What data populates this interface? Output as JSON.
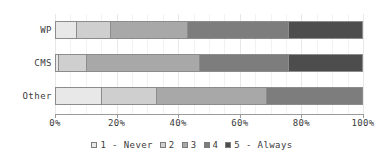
{
  "chart_data": {
    "type": "bar",
    "orientation": "horizontal",
    "stacked": "100%",
    "title": "",
    "xlabel": "",
    "ylabel": "",
    "categories": [
      "WP",
      "CMS",
      "Other"
    ],
    "xlim": [
      0,
      100
    ],
    "xticks": [
      0,
      20,
      40,
      60,
      80,
      100
    ],
    "xticklabels": [
      "0%",
      "20%",
      "40%",
      "60%",
      "80%",
      "100%"
    ],
    "grid": true,
    "legend_position": "bottom",
    "series": [
      {
        "name": "1 - Never",
        "color": "#e8e8e8",
        "values": [
          7,
          1,
          15
        ]
      },
      {
        "name": "2",
        "color": "#cfcfcf",
        "values": [
          11,
          9,
          18
        ]
      },
      {
        "name": "3",
        "color": "#a8a8a8",
        "values": [
          25,
          37,
          36
        ]
      },
      {
        "name": "4",
        "color": "#7d7d7d",
        "values": [
          33,
          29,
          31
        ]
      },
      {
        "name": "5 - Always",
        "color": "#4d4d4d",
        "values": [
          24,
          24,
          0
        ]
      }
    ]
  },
  "axis": {
    "ticks": [
      {
        "label": "0%",
        "value": 0
      },
      {
        "label": "20%",
        "value": 20
      },
      {
        "label": "40%",
        "value": 40
      },
      {
        "label": "60%",
        "value": 60
      },
      {
        "label": "80%",
        "value": 80
      },
      {
        "label": "100%",
        "value": 100
      }
    ]
  },
  "categories": [
    {
      "label": "WP"
    },
    {
      "label": "CMS"
    },
    {
      "label": "Other"
    }
  ],
  "legend": {
    "items": [
      {
        "label": "1 - Never",
        "color": "#e8e8e8"
      },
      {
        "label": "2",
        "color": "#cfcfcf"
      },
      {
        "label": "3",
        "color": "#a8a8a8"
      },
      {
        "label": "4",
        "color": "#7d7d7d"
      },
      {
        "label": "5 - Always",
        "color": "#4d4d4d"
      }
    ]
  }
}
